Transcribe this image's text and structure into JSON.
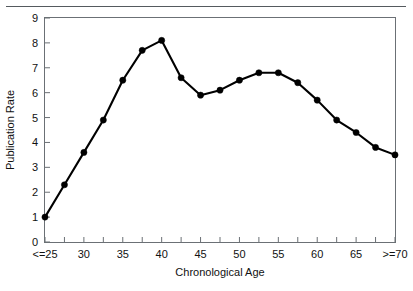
{
  "chart_data": {
    "type": "line",
    "title": "",
    "xlabel": "Chronological Age",
    "ylabel": "Publication Rate",
    "x": [
      25,
      27.5,
      30,
      32.5,
      35,
      37.5,
      40,
      42.5,
      45,
      47.5,
      50,
      52.5,
      55,
      57.5,
      60,
      62.5,
      65,
      67.5,
      70
    ],
    "values": [
      1.0,
      2.3,
      3.6,
      4.9,
      6.5,
      7.7,
      8.1,
      6.6,
      5.9,
      6.1,
      6.5,
      6.8,
      6.8,
      6.4,
      5.7,
      4.9,
      4.4,
      3.8,
      3.5
    ],
    "x_tick_labels": [
      "<=25",
      "",
      "30",
      "",
      "35",
      "",
      "40",
      "",
      "45",
      "",
      "50",
      "",
      "55",
      "",
      "60",
      "",
      "65",
      "",
      ">=70"
    ],
    "x_major_labels": [
      "<=25",
      "30",
      "35",
      "40",
      "45",
      "50",
      "55",
      "60",
      "65",
      ">=70"
    ],
    "y_tick_labels": [
      "0",
      "1",
      "2",
      "3",
      "4",
      "5",
      "6",
      "7",
      "8",
      "9"
    ],
    "ylim": [
      0,
      9
    ],
    "xlim": [
      25,
      70
    ],
    "grid": false,
    "legend": "none",
    "marker": "filled-circle",
    "line_color": "#000000",
    "marker_color": "#000000",
    "frame_color": "#6b7075"
  }
}
